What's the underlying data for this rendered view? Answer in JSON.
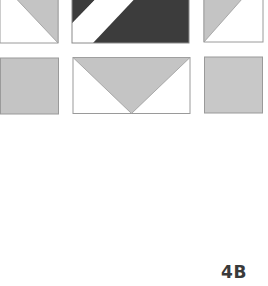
{
  "figure": {
    "label": "4B",
    "colors": {
      "light_gray": "#c4c4c4",
      "dark_gray": "#3c3c3c",
      "white": "#ffffff",
      "outline": "#9a9a9a"
    },
    "tiles": [
      {
        "id": "top-left",
        "description": "half-square triangle, gray upper-right, white lower-left"
      },
      {
        "id": "top-middle",
        "description": "dark rectangle with white diagonal stripe"
      },
      {
        "id": "top-right",
        "description": "half-square triangle, gray upper-left, white lower-right"
      },
      {
        "id": "bottom-left",
        "description": "solid gray square"
      },
      {
        "id": "bottom-middle",
        "description": "flying-geese rectangle, gray downward triangle on white"
      },
      {
        "id": "bottom-right",
        "description": "solid gray square"
      }
    ]
  }
}
